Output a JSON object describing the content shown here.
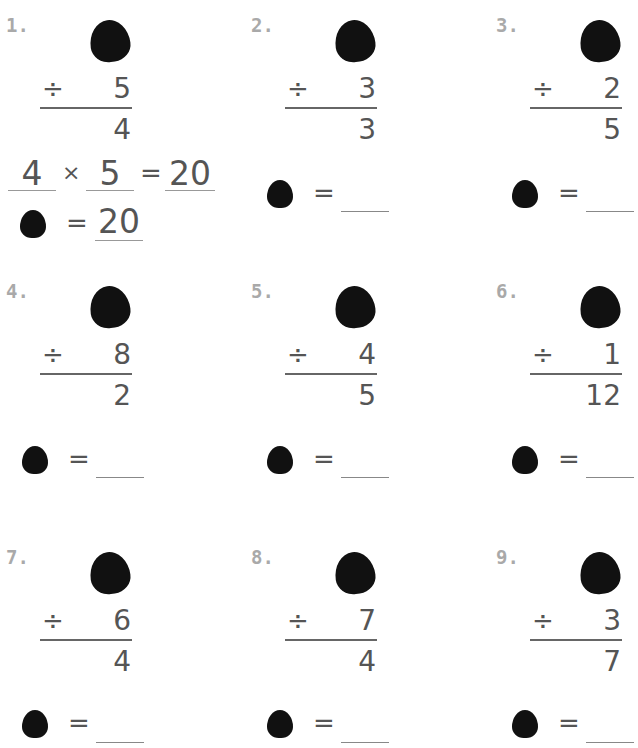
{
  "worksheet": {
    "operator_symbol": "÷",
    "equals_symbol": "=",
    "times_symbol": "×",
    "problems": [
      {
        "label": "1.",
        "divisor": "5",
        "quotient": "4",
        "worked": {
          "a": "4",
          "b": "5",
          "product": "20",
          "answer": "20"
        }
      },
      {
        "label": "2.",
        "divisor": "3",
        "quotient": "3",
        "answer": ""
      },
      {
        "label": "3.",
        "divisor": "2",
        "quotient": "5",
        "answer": ""
      },
      {
        "label": "4.",
        "divisor": "8",
        "quotient": "2",
        "answer": ""
      },
      {
        "label": "5.",
        "divisor": "4",
        "quotient": "5",
        "answer": ""
      },
      {
        "label": "6.",
        "divisor": "1",
        "quotient": "12",
        "answer": ""
      },
      {
        "label": "7.",
        "divisor": "6",
        "quotient": "4",
        "answer": ""
      },
      {
        "label": "8.",
        "divisor": "7",
        "quotient": "4",
        "answer": ""
      },
      {
        "label": "9.",
        "divisor": "3",
        "quotient": "7",
        "answer": ""
      }
    ]
  }
}
